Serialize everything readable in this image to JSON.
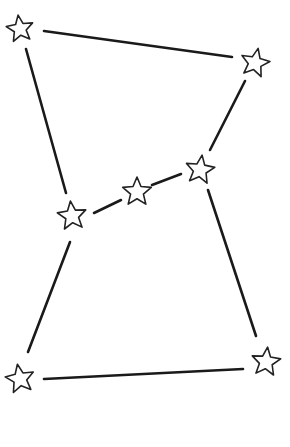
{
  "diagram": {
    "type": "constellation",
    "background": "#ffffff",
    "line_color": "#1a1a1a",
    "star_fill": "#ffffff",
    "star_stroke": "#222222",
    "stars": [
      {
        "id": "top-left",
        "x": 20,
        "y": 29,
        "r": 14,
        "rot": -8
      },
      {
        "id": "top-right",
        "x": 255,
        "y": 63,
        "r": 15,
        "rot": 12
      },
      {
        "id": "belt-right",
        "x": 200,
        "y": 170,
        "r": 15,
        "rot": 8
      },
      {
        "id": "belt-middle",
        "x": 137,
        "y": 192,
        "r": 15,
        "rot": 0
      },
      {
        "id": "belt-left",
        "x": 72,
        "y": 216,
        "r": 15,
        "rot": -6
      },
      {
        "id": "bottom-left",
        "x": 20,
        "y": 379,
        "r": 15,
        "rot": -10
      },
      {
        "id": "bottom-right",
        "x": 266,
        "y": 362,
        "r": 15,
        "rot": 6
      }
    ],
    "lines": [
      {
        "x1": 44,
        "y1": 31,
        "x2": 232,
        "y2": 57
      },
      {
        "x1": 26,
        "y1": 49,
        "x2": 66,
        "y2": 193
      },
      {
        "x1": 245,
        "y1": 81,
        "x2": 210,
        "y2": 150
      },
      {
        "x1": 94,
        "y1": 213,
        "x2": 121,
        "y2": 200
      },
      {
        "x1": 152,
        "y1": 185,
        "x2": 181,
        "y2": 174
      },
      {
        "x1": 70,
        "y1": 242,
        "x2": 28,
        "y2": 352
      },
      {
        "x1": 208,
        "y1": 190,
        "x2": 256,
        "y2": 336
      },
      {
        "x1": 44,
        "y1": 379,
        "x2": 243,
        "y2": 369
      }
    ]
  }
}
